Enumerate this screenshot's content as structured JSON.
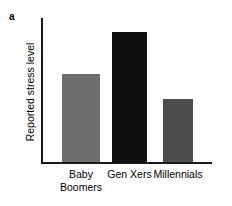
{
  "figure": {
    "panel_label": "a",
    "background_color": "#ffffff",
    "axis_color": "#1a1a1a"
  },
  "chart_data": {
    "type": "bar",
    "title": "",
    "subtitle": "",
    "panel": "a",
    "categories": [
      "Baby\nBoomers",
      "Gen Xers",
      "Millennials"
    ],
    "category_labels_flat": [
      "Baby Boomers",
      "Gen Xers",
      "Millennials"
    ],
    "values": [
      61,
      90,
      44
    ],
    "value_unit": "relative (% of axis height, unlabeled axis)",
    "xlabel": "",
    "ylabel": "Reported stress level",
    "ylim": [
      0,
      100
    ],
    "y_ticks": [],
    "y_tick_labels": [],
    "x_ticks": [
      "Baby Boomers",
      "Gen Xers",
      "Millennials"
    ],
    "grid": false,
    "legend": null,
    "legend_position": "none",
    "annotations": [],
    "bar_colors": [
      "#6e6e6e",
      "#0f0f0f",
      "#4d4d4d"
    ],
    "bars": [
      {
        "label": "Baby Boomers",
        "label_line1": "Baby",
        "label_line2": "Boomers",
        "value": 61,
        "color": "#6e6e6e",
        "left_px": 21,
        "width_px": 38
      },
      {
        "label": "Gen Xers",
        "label_line1": "Gen Xers",
        "label_line2": "",
        "value": 90,
        "color": "#0f0f0f",
        "left_px": 71,
        "width_px": 35
      },
      {
        "label": "Millennials",
        "label_line1": "Millennials",
        "label_line2": "",
        "value": 44,
        "color": "#4d4d4d",
        "left_px": 122,
        "width_px": 30
      }
    ]
  }
}
